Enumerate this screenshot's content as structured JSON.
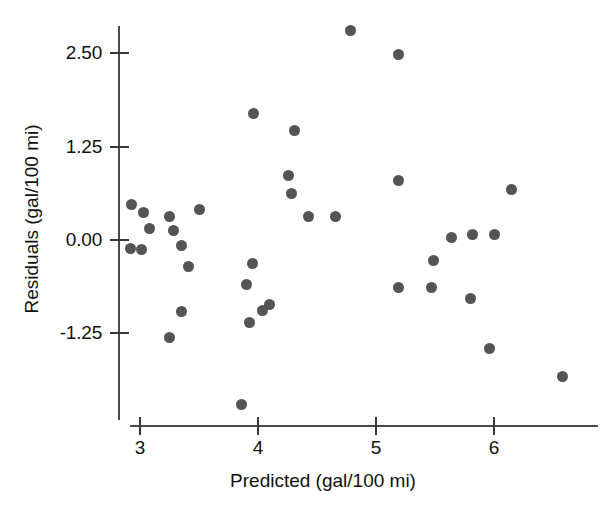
{
  "chart_data": {
    "type": "scatter",
    "title": "",
    "xlabel": "Predicted (gal/100 mi)",
    "ylabel": "Residuals (gal/100 mi)",
    "xlim": [
      2.82,
      6.77
    ],
    "ylim": [
      -2.62,
      3.08
    ],
    "grid": false,
    "legend": null,
    "xticks": [
      3,
      4,
      5,
      6
    ],
    "xtick_labels": [
      "3",
      "4",
      "5",
      "6"
    ],
    "yticks": [
      2.5,
      1.25,
      0,
      -1.25
    ],
    "ytick_labels": [
      "2.50",
      "1.25",
      "0.00",
      "-1.25"
    ],
    "marker_color": "#545454",
    "marker_size": 11,
    "points": [
      {
        "x": 2.93,
        "y": 0.48
      },
      {
        "x": 2.92,
        "y": -0.12
      },
      {
        "x": 3.01,
        "y": -0.13
      },
      {
        "x": 3.03,
        "y": 0.37
      },
      {
        "x": 3.08,
        "y": 0.15
      },
      {
        "x": 3.25,
        "y": 0.32
      },
      {
        "x": 3.25,
        "y": -1.3
      },
      {
        "x": 3.28,
        "y": 0.13
      },
      {
        "x": 3.35,
        "y": -0.08
      },
      {
        "x": 3.35,
        "y": -0.96
      },
      {
        "x": 3.41,
        "y": -0.36
      },
      {
        "x": 3.5,
        "y": 0.41
      },
      {
        "x": 3.86,
        "y": -2.2
      },
      {
        "x": 3.9,
        "y": -0.59
      },
      {
        "x": 3.93,
        "y": -1.1
      },
      {
        "x": 3.95,
        "y": -0.31
      },
      {
        "x": 3.96,
        "y": 1.69
      },
      {
        "x": 4.04,
        "y": -0.95
      },
      {
        "x": 4.1,
        "y": -0.86
      },
      {
        "x": 4.26,
        "y": 0.87
      },
      {
        "x": 4.28,
        "y": 0.62
      },
      {
        "x": 4.31,
        "y": 1.46
      },
      {
        "x": 4.43,
        "y": 0.31
      },
      {
        "x": 4.66,
        "y": 0.31
      },
      {
        "x": 4.78,
        "y": 2.8
      },
      {
        "x": 5.19,
        "y": 2.48
      },
      {
        "x": 5.19,
        "y": 0.79
      },
      {
        "x": 5.19,
        "y": -0.64
      },
      {
        "x": 5.47,
        "y": -0.63
      },
      {
        "x": 5.49,
        "y": -0.28
      },
      {
        "x": 5.64,
        "y": 0.04
      },
      {
        "x": 5.8,
        "y": -0.78
      },
      {
        "x": 5.82,
        "y": 0.08
      },
      {
        "x": 5.96,
        "y": -1.45
      },
      {
        "x": 6.0,
        "y": 0.08
      },
      {
        "x": 6.15,
        "y": 0.67
      },
      {
        "x": 6.58,
        "y": -1.83
      }
    ]
  },
  "axes": {
    "x_origin_px": 140,
    "x_unit_px": 118,
    "y_origin_px": 240,
    "y_unit_px": 74.7,
    "y_axis_top_px": 26,
    "y_axis_bottom_px": 420,
    "x_axis_left_px": 130,
    "x_axis_right_px": 598
  }
}
